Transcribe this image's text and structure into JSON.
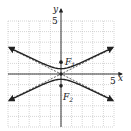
{
  "chart_data": {
    "type": "line",
    "title": "",
    "xlabel": "x",
    "ylabel": "y",
    "xlim": [
      -5,
      5
    ],
    "ylim": [
      -5,
      5
    ],
    "grid": true,
    "tick_labels": {
      "x": [
        "5"
      ],
      "y": [
        "5"
      ]
    },
    "hyperbola": {
      "a": 0.5,
      "b": 1,
      "c": 1.12,
      "orientation": "vertical",
      "center": [
        0,
        0
      ]
    },
    "asymptotes": [
      {
        "slope": 0.5,
        "intercept": 0,
        "style": "dashed"
      },
      {
        "slope": -0.5,
        "intercept": 0,
        "style": "dashed"
      }
    ],
    "points": [
      {
        "name": "F1",
        "x": 0,
        "y": 1.12,
        "label": "F",
        "sub": "1"
      },
      {
        "name": "F2",
        "x": 0,
        "y": -1.12,
        "label": "F",
        "sub": "2"
      },
      {
        "name": "center",
        "x": 0,
        "y": 0
      }
    ]
  },
  "labels": {
    "x_axis": "x",
    "y_axis": "y",
    "x_tick": "5",
    "y_tick": "5",
    "f1_main": "F",
    "f1_sub": "1",
    "f2_main": "F",
    "f2_sub": "2"
  }
}
